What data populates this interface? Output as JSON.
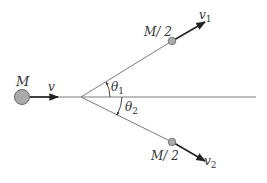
{
  "diagram": {
    "type": "physics-collision-decay",
    "colors": {
      "line": "#6e6e6e",
      "arrow": "#222222",
      "ball_fill": "#aaaaaa",
      "ball_stroke": "#666666",
      "text": "#333333"
    },
    "incoming": {
      "mass_label": "M",
      "velocity_label": "v"
    },
    "fragment_upper": {
      "mass_label": "M/ 2",
      "velocity_label": "v",
      "velocity_subscript": "1",
      "angle_label": "θ",
      "angle_subscript": "1"
    },
    "fragment_lower": {
      "mass_label": "M/ 2",
      "velocity_label": "v",
      "velocity_subscript": "2",
      "angle_label": "θ",
      "angle_subscript": "2"
    }
  }
}
